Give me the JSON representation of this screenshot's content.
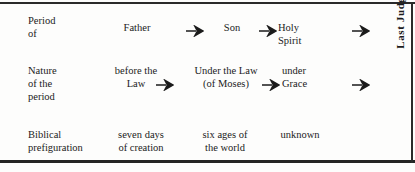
{
  "figure": {
    "side_label": "Last Judgment",
    "arrow_icon": "right-arrow-icon",
    "rows": [
      {
        "id": "period-of",
        "label": "Period\nof",
        "cells": [
          "Father",
          "Son",
          "Holy\nSpirit"
        ]
      },
      {
        "id": "nature-of-the-period",
        "label": "Nature\nof the\nperiod",
        "cells": [
          "before the\nLaw",
          "Under the Law\n(of Moses)",
          "under\nGrace"
        ]
      },
      {
        "id": "biblical-prefiguration",
        "label": "Biblical\nprefiguration",
        "cells": [
          "seven days\nof creation",
          "six ages of\nthe world",
          "unknown"
        ]
      }
    ]
  },
  "colors": {
    "ink": "#1b1b1b",
    "rule": "#2a2a2a",
    "paper": "#fdfdfc"
  }
}
